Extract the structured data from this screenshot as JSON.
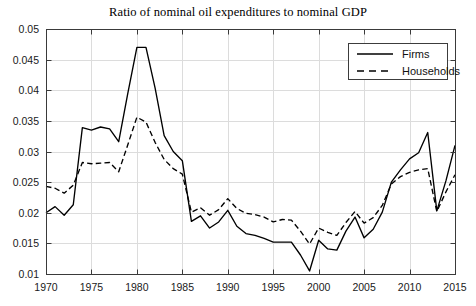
{
  "chart_data": {
    "type": "line",
    "title": "Ratio of nominal oil expenditures to nominal GDP",
    "xlabel": "",
    "ylabel": "",
    "xlim": [
      1970,
      2015
    ],
    "ylim": [
      0.01,
      0.05
    ],
    "grid": true,
    "legend_position": "top-right",
    "xticks": [
      1970,
      1975,
      1980,
      1985,
      1990,
      1995,
      2000,
      2005,
      2010,
      2015
    ],
    "xtick_labels": [
      "1970",
      "1975",
      "1980",
      "1985",
      "1990",
      "1995",
      "2000",
      "2005",
      "2010",
      "2015"
    ],
    "yticks": [
      0.01,
      0.015,
      0.02,
      0.025,
      0.03,
      0.035,
      0.04,
      0.045,
      0.05
    ],
    "ytick_labels": [
      "0.01",
      "0.015",
      "0.02",
      "0.025",
      "0.03",
      "0.035",
      "0.04",
      "0.045",
      "0.05"
    ],
    "x": [
      1970,
      1971,
      1972,
      1973,
      1974,
      1975,
      1976,
      1977,
      1978,
      1979,
      1980,
      1981,
      1982,
      1983,
      1984,
      1985,
      1986,
      1987,
      1988,
      1989,
      1990,
      1991,
      1992,
      1993,
      1994,
      1995,
      1996,
      1997,
      1998,
      1999,
      2000,
      2001,
      2002,
      2003,
      2004,
      2005,
      2006,
      2007,
      2008,
      2009,
      2010,
      2011,
      2012,
      2013,
      2014,
      2015
    ],
    "series": [
      {
        "name": "Firms",
        "style": "solid",
        "color": "#000000",
        "values": [
          0.02,
          0.021,
          0.0196,
          0.0213,
          0.0339,
          0.0335,
          0.034,
          0.0337,
          0.0316,
          0.0395,
          0.047,
          0.047,
          0.0404,
          0.0326,
          0.03,
          0.0285,
          0.0186,
          0.0195,
          0.0175,
          0.0185,
          0.0204,
          0.0178,
          0.0166,
          0.0163,
          0.0158,
          0.0152,
          0.0152,
          0.0152,
          0.0131,
          0.0105,
          0.0155,
          0.0141,
          0.0139,
          0.017,
          0.0193,
          0.0159,
          0.0173,
          0.0201,
          0.025,
          0.027,
          0.0288,
          0.0298,
          0.0331,
          0.0203,
          0.0252,
          0.031
        ]
      },
      {
        "name": "Households",
        "style": "dashed",
        "color": "#000000",
        "values": [
          0.0243,
          0.024,
          0.0232,
          0.0245,
          0.0282,
          0.028,
          0.0281,
          0.0282,
          0.0267,
          0.0311,
          0.0356,
          0.0348,
          0.0315,
          0.0287,
          0.0272,
          0.0263,
          0.0201,
          0.0208,
          0.0196,
          0.0205,
          0.0223,
          0.0207,
          0.0199,
          0.0197,
          0.0193,
          0.0185,
          0.0189,
          0.0188,
          0.017,
          0.0149,
          0.0175,
          0.0168,
          0.0163,
          0.0184,
          0.0202,
          0.0183,
          0.0192,
          0.0212,
          0.0247,
          0.0259,
          0.0266,
          0.027,
          0.0272,
          0.0202,
          0.0234,
          0.0262
        ]
      }
    ]
  },
  "legend": {
    "entries": [
      {
        "label": "Firms"
      },
      {
        "label": "Households"
      }
    ]
  },
  "axes": {
    "geometry": {
      "left": 46,
      "top": 29,
      "right": 455,
      "bottom": 274
    }
  }
}
